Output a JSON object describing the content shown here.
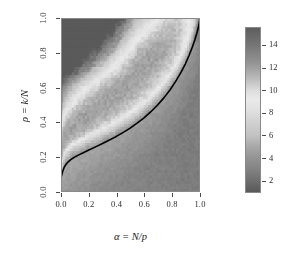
{
  "chart_data": {
    "type": "heatmap",
    "title": "",
    "xlabel": "α = N/p",
    "ylabel": "ρ = k/N",
    "xlim": [
      0.0,
      1.0
    ],
    "ylim": [
      0.0,
      1.0
    ],
    "xticks": [
      "0.0",
      "0.2",
      "0.4",
      "0.6",
      "0.8",
      "1.0"
    ],
    "xtick_values": [
      0.0,
      0.2,
      0.4,
      0.6,
      0.8,
      1.0
    ],
    "yticks": [
      "0.0",
      "0.2",
      "0.4",
      "0.6",
      "0.8",
      "1.0"
    ],
    "ytick_values": [
      0.0,
      0.2,
      0.4,
      0.6,
      0.8,
      1.0
    ],
    "grid": false,
    "colorbar": {
      "ticks": [
        "14",
        "12",
        "10",
        "8",
        "6",
        "4",
        "2"
      ],
      "tick_values": [
        14,
        12,
        10,
        8,
        6,
        4,
        2
      ],
      "vmin": 1.0,
      "vmax": 15.5,
      "orientation": "vertical",
      "position": "right",
      "colormap": "gray-nonmonotonic",
      "stops": [
        {
          "value": 15.5,
          "color": "#5e5e5e"
        },
        {
          "value": 14.0,
          "color": "#767676"
        },
        {
          "value": 12.5,
          "color": "#929292"
        },
        {
          "value": 11.0,
          "color": "#bcbcbc"
        },
        {
          "value": 10.0,
          "color": "#dcdcdc"
        },
        {
          "value": 9.2,
          "color": "#eaeaea"
        },
        {
          "value": 8.2,
          "color": "#e0e0e0"
        },
        {
          "value": 7.0,
          "color": "#cfcfcf"
        },
        {
          "value": 6.0,
          "color": "#c2c2c2"
        },
        {
          "value": 5.0,
          "color": "#a8a8a8"
        },
        {
          "value": 4.0,
          "color": "#949494"
        },
        {
          "value": 3.0,
          "color": "#838383"
        },
        {
          "value": 2.0,
          "color": "#6f6f6f"
        },
        {
          "value": 1.0,
          "color": "#5a5a5a"
        }
      ]
    },
    "overlay_curve": {
      "name": "phase-transition-boundary",
      "color": "#000000",
      "linewidth": 1.6,
      "points": [
        [
          0.0,
          0.082
        ],
        [
          0.005,
          0.098
        ],
        [
          0.012,
          0.118
        ],
        [
          0.022,
          0.14
        ],
        [
          0.035,
          0.158
        ],
        [
          0.05,
          0.172
        ],
        [
          0.07,
          0.186
        ],
        [
          0.095,
          0.199
        ],
        [
          0.125,
          0.212
        ],
        [
          0.16,
          0.226
        ],
        [
          0.2,
          0.241
        ],
        [
          0.245,
          0.258
        ],
        [
          0.295,
          0.277
        ],
        [
          0.345,
          0.297
        ],
        [
          0.395,
          0.318
        ],
        [
          0.445,
          0.341
        ],
        [
          0.495,
          0.366
        ],
        [
          0.545,
          0.394
        ],
        [
          0.595,
          0.425
        ],
        [
          0.645,
          0.46
        ],
        [
          0.695,
          0.5
        ],
        [
          0.74,
          0.541
        ],
        [
          0.785,
          0.588
        ],
        [
          0.825,
          0.636
        ],
        [
          0.862,
          0.686
        ],
        [
          0.895,
          0.737
        ],
        [
          0.922,
          0.786
        ],
        [
          0.945,
          0.833
        ],
        [
          0.963,
          0.875
        ],
        [
          0.977,
          0.912
        ],
        [
          0.988,
          0.945
        ],
        [
          0.995,
          0.972
        ],
        [
          0.999,
          0.99
        ],
        [
          1.0,
          1.0
        ]
      ]
    },
    "field_description": {
      "bright_band_note": "diagonal bright ridge running from upper-left toward upper-right",
      "dark_regions": [
        "top-left corner",
        "bottom band below the curve"
      ],
      "grid_cells_x": 64,
      "grid_cells_y": 64
    }
  },
  "colorbar_ticks": [
    {
      "label": "14",
      "value": 14
    },
    {
      "label": "12",
      "value": 12
    },
    {
      "label": "10",
      "value": 10
    },
    {
      "label": "8",
      "value": 8
    },
    {
      "label": "6",
      "value": 6
    },
    {
      "label": "4",
      "value": 4
    },
    {
      "label": "2",
      "value": 2
    }
  ]
}
